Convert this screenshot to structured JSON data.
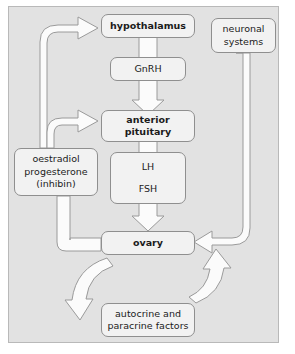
{
  "diagram": {
    "type": "flow-diagram",
    "colors": {
      "panel_background": "#e2e2e2",
      "node_fill": "#f2f2f2",
      "node_border": "#8f8f8f",
      "arrow_fill": "#fbfbfb",
      "arrow_stroke": "#9a9a9a",
      "text": "#1b1b1b",
      "page_background": "#ffffff"
    },
    "nodes": [
      {
        "id": "hypothalamus",
        "lines": [
          "hypothalamus"
        ],
        "bold": true
      },
      {
        "id": "neuronal_systems",
        "lines": [
          "neuronal",
          "systems"
        ],
        "bold": false
      },
      {
        "id": "gnrh",
        "lines": [
          "GnRH"
        ],
        "bold": false
      },
      {
        "id": "anterior_pituitary",
        "lines": [
          "anterior",
          "pituitary"
        ],
        "bold": true
      },
      {
        "id": "lh_fsh",
        "lines": [
          "LH",
          "FSH"
        ],
        "bold": false
      },
      {
        "id": "steroids",
        "lines": [
          "oestradiol",
          "progesterone",
          "(inhibin)"
        ],
        "bold": false
      },
      {
        "id": "ovary",
        "lines": [
          "ovary"
        ],
        "bold": true
      },
      {
        "id": "autocrine",
        "lines": [
          "autocrine and",
          "paracrine factors"
        ],
        "bold": false
      }
    ],
    "edges": [
      {
        "id": "hypothalamus-to-gnrh-to-pituitary",
        "from": "hypothalamus",
        "to": "anterior_pituitary",
        "via": "gnrh",
        "style": "block-arrow-down"
      },
      {
        "id": "pituitary-to-lhfsh-to-ovary",
        "from": "anterior_pituitary",
        "to": "ovary",
        "via": "lh_fsh",
        "style": "block-arrow-down"
      },
      {
        "id": "ovary-to-steroids",
        "from": "ovary",
        "to": "steroids",
        "style": "band-left-up"
      },
      {
        "id": "steroids-to-hypothalamus",
        "from": "steroids",
        "to": "hypothalamus",
        "style": "curved-arrow-up-right"
      },
      {
        "id": "steroids-to-pituitary",
        "from": "steroids",
        "to": "anterior_pituitary",
        "style": "curved-arrow-right"
      },
      {
        "id": "neuronal-to-ovary",
        "from": "neuronal_systems",
        "to": "ovary",
        "style": "curved-arrow-down-left"
      },
      {
        "id": "ovary-to-autocrine",
        "from": "ovary",
        "to": "autocrine",
        "style": "curved-arrow-down"
      },
      {
        "id": "autocrine-to-ovary",
        "from": "autocrine",
        "to": "ovary",
        "style": "curved-arrow-up"
      }
    ]
  }
}
